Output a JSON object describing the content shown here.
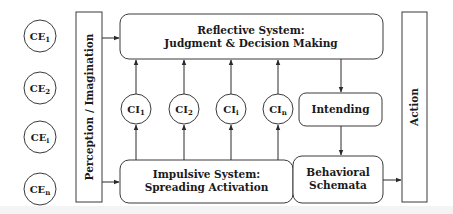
{
  "diagram": {
    "colors": {
      "stroke": "#3a3a3a",
      "text": "#1a1a1a",
      "background": "#ffffff"
    },
    "external_entities": [
      {
        "id": "CE1",
        "base": "CE",
        "sub": "1",
        "cx": 40,
        "cy": 36
      },
      {
        "id": "CE2",
        "base": "CE",
        "sub": "2",
        "cx": 40,
        "cy": 88
      },
      {
        "id": "CEi",
        "base": "CE",
        "sub": "i",
        "cx": 40,
        "cy": 137
      },
      {
        "id": "CEn",
        "base": "CE",
        "sub": "n",
        "cx": 40,
        "cy": 189
      }
    ],
    "perception": {
      "label": "Perception / Imagination"
    },
    "reflective": {
      "line1": "Reflective System:",
      "line2": "Judgment & Decision Making"
    },
    "internal_concepts": [
      {
        "id": "CI1",
        "base": "CI",
        "sub": "1",
        "cx": 136,
        "cy": 109
      },
      {
        "id": "CI2",
        "base": "CI",
        "sub": "2",
        "cx": 184,
        "cy": 109
      },
      {
        "id": "CIi",
        "base": "CI",
        "sub": "i",
        "cx": 231,
        "cy": 109
      },
      {
        "id": "CIn",
        "base": "CI",
        "sub": "n",
        "cx": 278,
        "cy": 109
      }
    ],
    "intending": {
      "label": "Intending"
    },
    "impulsive": {
      "line1": "Impulsive System:",
      "line2": "Spreading Activation"
    },
    "behavioral": {
      "line1": "Behavioral",
      "line2": "Schemata"
    },
    "action": {
      "label": "Action"
    }
  }
}
